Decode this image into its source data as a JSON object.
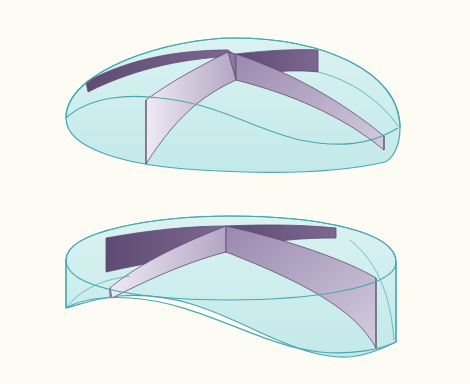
{
  "figure": {
    "background": "#fdfcf4",
    "colors": {
      "shell_fill": "#cdeeee",
      "shell_stroke": "#4aa8b4",
      "vane_dark": "#6e5a80",
      "vane_mid": "#a896b8",
      "vane_light": "#e2dcea",
      "edge": "#5e4c6e"
    },
    "shapes": [
      {
        "name": "upper-dome",
        "description": "Dome-shaped transparent shell with intersecting curved vanes"
      },
      {
        "name": "lower-cylinder",
        "description": "Cylindrical transparent shell with warped base and intersecting vanes"
      }
    ]
  }
}
